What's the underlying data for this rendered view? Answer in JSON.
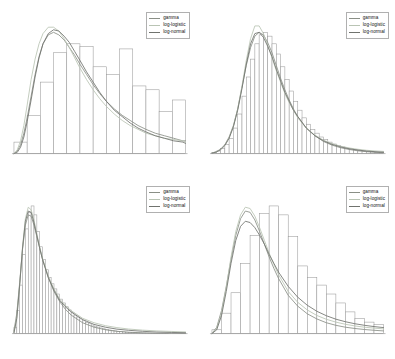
{
  "figure": {
    "kind": "density-comparison-histogram-grid",
    "rows": 2,
    "columns": 2,
    "background": "#ffffff"
  },
  "style": {
    "bar_fill": "#ffffff",
    "bar_stroke": "#9a9a9a",
    "axis_color": "#8f8f8f",
    "legend_border": "#b0b0b0",
    "legend_text_color": "#111111"
  },
  "legend": {
    "position": "top-right",
    "entries": [
      {
        "label": "gamma",
        "color": "#8a8f86"
      },
      {
        "label": "log-logistic",
        "color": "#b9c4b4"
      },
      {
        "label": "log-normal",
        "color": "#70736e"
      }
    ]
  },
  "chart_data": [
    {
      "type": "bar",
      "id": "panel-1",
      "title": "",
      "xlabel": "",
      "ylabel": "",
      "grid": false,
      "legend_position": "top-right",
      "xlim": [
        0,
        13
      ],
      "ylim": [
        0,
        1
      ],
      "categories": [
        "b1",
        "b2",
        "b3",
        "b4",
        "b5",
        "b6",
        "b7",
        "b8",
        "b9",
        "b10",
        "b11",
        "b12",
        "b13"
      ],
      "values": [
        0.09,
        0.3,
        0.56,
        0.79,
        0.86,
        0.84,
        0.68,
        0.62,
        0.82,
        0.53,
        0.5,
        0.33,
        0.42
      ],
      "series": [
        {
          "name": "gamma",
          "color": "#8a8f86",
          "x": [
            0.0,
            0.25,
            0.5,
            0.75,
            1.0,
            1.3,
            1.6,
            1.9,
            2.2,
            2.6,
            3.0,
            3.4,
            3.8,
            4.2,
            4.6,
            5.0,
            5.5,
            6.0,
            6.5,
            7.0,
            7.6,
            8.2,
            8.8,
            9.4,
            10.0,
            10.7,
            11.4,
            12.1,
            12.8,
            13.0
          ],
          "y": [
            0.0,
            0.02,
            0.07,
            0.16,
            0.28,
            0.45,
            0.62,
            0.76,
            0.86,
            0.93,
            0.95,
            0.93,
            0.89,
            0.83,
            0.77,
            0.7,
            0.62,
            0.54,
            0.47,
            0.41,
            0.35,
            0.3,
            0.26,
            0.22,
            0.19,
            0.16,
            0.14,
            0.12,
            0.1,
            0.1
          ]
        },
        {
          "name": "log-logistic",
          "color": "#b9c4b4",
          "x": [
            0.0,
            0.25,
            0.5,
            0.75,
            1.0,
            1.3,
            1.6,
            1.9,
            2.2,
            2.6,
            3.0,
            3.4,
            3.8,
            4.2,
            4.6,
            5.0,
            5.5,
            6.0,
            6.5,
            7.0,
            7.6,
            8.2,
            8.8,
            9.4,
            10.0,
            10.7,
            11.4,
            12.1,
            12.8,
            13.0
          ],
          "y": [
            0.0,
            0.03,
            0.1,
            0.22,
            0.38,
            0.58,
            0.74,
            0.86,
            0.94,
            0.99,
            0.99,
            0.96,
            0.9,
            0.83,
            0.75,
            0.67,
            0.58,
            0.5,
            0.43,
            0.37,
            0.31,
            0.26,
            0.22,
            0.19,
            0.16,
            0.14,
            0.12,
            0.11,
            0.1,
            0.09
          ]
        },
        {
          "name": "log-normal",
          "color": "#70736e",
          "x": [
            0.0,
            0.25,
            0.5,
            0.75,
            1.0,
            1.3,
            1.6,
            1.9,
            2.2,
            2.6,
            3.0,
            3.4,
            3.8,
            4.2,
            4.6,
            5.0,
            5.5,
            6.0,
            6.5,
            7.0,
            7.6,
            8.2,
            8.8,
            9.4,
            10.0,
            10.7,
            11.4,
            12.1,
            12.8,
            13.0
          ],
          "y": [
            0.0,
            0.01,
            0.05,
            0.13,
            0.25,
            0.42,
            0.6,
            0.75,
            0.86,
            0.94,
            0.97,
            0.96,
            0.92,
            0.87,
            0.8,
            0.73,
            0.64,
            0.56,
            0.48,
            0.41,
            0.34,
            0.29,
            0.24,
            0.2,
            0.17,
            0.14,
            0.12,
            0.1,
            0.09,
            0.08
          ]
        }
      ]
    },
    {
      "type": "bar",
      "id": "panel-2",
      "title": "",
      "xlabel": "",
      "ylabel": "",
      "grid": false,
      "legend_position": "top-right",
      "xlim": [
        0,
        40
      ],
      "ylim": [
        0,
        1
      ],
      "categories": [
        "b1",
        "b2",
        "b3",
        "b4",
        "b5",
        "b6",
        "b7",
        "b8",
        "b9",
        "b10",
        "b11",
        "b12",
        "b13",
        "b14",
        "b15",
        "b16",
        "b17",
        "b18",
        "b19",
        "b20",
        "b21",
        "b22",
        "b23",
        "b24",
        "b25",
        "b26",
        "b27",
        "b28",
        "b29",
        "b30",
        "b31",
        "b32",
        "b33",
        "b34",
        "b35",
        "b36",
        "b37",
        "b38",
        "b39",
        "b40"
      ],
      "values": [
        0.01,
        0.02,
        0.04,
        0.07,
        0.12,
        0.2,
        0.31,
        0.45,
        0.6,
        0.74,
        0.86,
        0.93,
        0.95,
        0.92,
        0.86,
        0.78,
        0.68,
        0.58,
        0.49,
        0.41,
        0.34,
        0.28,
        0.23,
        0.19,
        0.16,
        0.13,
        0.11,
        0.09,
        0.075,
        0.062,
        0.052,
        0.043,
        0.036,
        0.03,
        0.025,
        0.021,
        0.017,
        0.014,
        0.011,
        0.008
      ],
      "series": [
        {
          "name": "gamma",
          "color": "#8a8f86",
          "x": [
            0,
            1,
            2,
            3,
            4,
            5,
            6,
            7,
            8,
            9,
            10,
            11,
            12,
            13,
            14,
            15,
            16,
            17,
            18,
            19,
            20,
            22,
            24,
            26,
            28,
            30,
            32,
            34,
            36,
            38,
            40
          ],
          "y": [
            0.005,
            0.015,
            0.035,
            0.07,
            0.13,
            0.22,
            0.35,
            0.52,
            0.69,
            0.83,
            0.92,
            0.95,
            0.93,
            0.87,
            0.79,
            0.69,
            0.59,
            0.5,
            0.42,
            0.35,
            0.29,
            0.2,
            0.14,
            0.095,
            0.066,
            0.046,
            0.032,
            0.022,
            0.015,
            0.01,
            0.007
          ]
        },
        {
          "name": "log-logistic",
          "color": "#b9c4b4",
          "x": [
            0,
            1,
            2,
            3,
            4,
            5,
            6,
            7,
            8,
            9,
            10,
            11,
            12,
            13,
            14,
            15,
            16,
            17,
            18,
            19,
            20,
            22,
            24,
            26,
            28,
            30,
            32,
            34,
            36,
            38,
            40
          ],
          "y": [
            0.004,
            0.013,
            0.032,
            0.065,
            0.125,
            0.215,
            0.35,
            0.53,
            0.73,
            0.9,
            1.0,
            1.0,
            0.94,
            0.85,
            0.75,
            0.65,
            0.56,
            0.47,
            0.4,
            0.34,
            0.28,
            0.2,
            0.145,
            0.105,
            0.078,
            0.058,
            0.044,
            0.034,
            0.026,
            0.021,
            0.017
          ]
        },
        {
          "name": "log-normal",
          "color": "#70736e",
          "x": [
            0,
            1,
            2,
            3,
            4,
            5,
            6,
            7,
            8,
            9,
            10,
            11,
            12,
            13,
            14,
            15,
            16,
            17,
            18,
            19,
            20,
            22,
            24,
            26,
            28,
            30,
            32,
            34,
            36,
            38,
            40
          ],
          "y": [
            0.003,
            0.012,
            0.03,
            0.063,
            0.12,
            0.21,
            0.34,
            0.51,
            0.7,
            0.86,
            0.94,
            0.95,
            0.91,
            0.84,
            0.76,
            0.66,
            0.57,
            0.48,
            0.41,
            0.34,
            0.29,
            0.2,
            0.14,
            0.1,
            0.072,
            0.052,
            0.038,
            0.028,
            0.02,
            0.015,
            0.011
          ]
        }
      ]
    },
    {
      "type": "bar",
      "id": "panel-3",
      "title": "",
      "xlabel": "",
      "ylabel": "",
      "grid": false,
      "legend_position": "top-right",
      "xlim": [
        0,
        60
      ],
      "ylim": [
        0,
        1
      ],
      "categories": [
        "b1",
        "b2",
        "b3",
        "b4",
        "b5",
        "b6",
        "b7",
        "b8",
        "b9",
        "b10",
        "b11",
        "b12",
        "b13",
        "b14",
        "b15",
        "b16",
        "b17",
        "b18",
        "b19",
        "b20",
        "b21",
        "b22",
        "b23",
        "b24",
        "b25",
        "b26",
        "b27",
        "b28",
        "b29",
        "b30",
        "b31",
        "b32",
        "b33",
        "b34",
        "b35",
        "b36",
        "b37",
        "b38",
        "b39",
        "b40",
        "b41",
        "b42",
        "b43",
        "b44",
        "b45",
        "b46",
        "b47",
        "b48",
        "b49",
        "b50",
        "b51",
        "b52",
        "b53",
        "b54",
        "b55",
        "b56",
        "b57",
        "b58",
        "b59",
        "b60"
      ],
      "values": [
        0.05,
        0.18,
        0.38,
        0.62,
        0.82,
        0.95,
        1.0,
        0.93,
        0.8,
        0.68,
        0.58,
        0.5,
        0.44,
        0.39,
        0.35,
        0.31,
        0.27,
        0.24,
        0.21,
        0.185,
        0.163,
        0.145,
        0.13,
        0.115,
        0.1,
        0.088,
        0.077,
        0.067,
        0.058,
        0.051,
        0.044,
        0.038,
        0.033,
        0.028,
        0.024,
        0.021,
        0.018,
        0.015,
        0.013,
        0.011,
        0.0095,
        0.008,
        0.007,
        0.006,
        0.005,
        0.0043,
        0.0037,
        0.0031,
        0.0027,
        0.0023,
        0.0019,
        0.0016,
        0.0014,
        0.0012,
        0.001,
        0.0008,
        0.0007,
        0.0006,
        0.0005,
        0.0004
      ],
      "series": [
        {
          "name": "gamma",
          "color": "#8a8f86",
          "x": [
            0,
            1,
            2,
            3,
            4,
            5,
            6,
            7,
            8,
            9,
            10,
            12,
            14,
            16,
            18,
            20,
            24,
            28,
            32,
            36,
            40,
            45,
            50,
            55,
            60
          ],
          "y": [
            0.02,
            0.16,
            0.4,
            0.66,
            0.85,
            0.93,
            0.92,
            0.85,
            0.76,
            0.67,
            0.58,
            0.44,
            0.33,
            0.25,
            0.19,
            0.145,
            0.085,
            0.05,
            0.03,
            0.018,
            0.011,
            0.006,
            0.003,
            0.002,
            0.001
          ]
        },
        {
          "name": "log-logistic",
          "color": "#b9c4b4",
          "x": [
            0,
            1,
            2,
            3,
            4,
            5,
            6,
            7,
            8,
            9,
            10,
            12,
            14,
            16,
            18,
            20,
            24,
            28,
            32,
            36,
            40,
            45,
            50,
            55,
            60
          ],
          "y": [
            0.01,
            0.13,
            0.38,
            0.68,
            0.9,
            0.99,
            0.97,
            0.89,
            0.78,
            0.68,
            0.59,
            0.45,
            0.35,
            0.27,
            0.22,
            0.18,
            0.12,
            0.085,
            0.062,
            0.047,
            0.036,
            0.027,
            0.021,
            0.017,
            0.013
          ]
        },
        {
          "name": "log-normal",
          "color": "#70736e",
          "x": [
            0,
            1,
            2,
            3,
            4,
            5,
            6,
            7,
            8,
            9,
            10,
            12,
            14,
            16,
            18,
            20,
            24,
            28,
            32,
            36,
            40,
            45,
            50,
            55,
            60
          ],
          "y": [
            0.005,
            0.12,
            0.38,
            0.67,
            0.88,
            0.96,
            0.95,
            0.87,
            0.77,
            0.67,
            0.58,
            0.44,
            0.34,
            0.26,
            0.21,
            0.17,
            0.11,
            0.072,
            0.05,
            0.035,
            0.026,
            0.018,
            0.012,
            0.009,
            0.007
          ]
        }
      ]
    },
    {
      "type": "bar",
      "id": "panel-4",
      "title": "",
      "xlabel": "",
      "ylabel": "",
      "grid": false,
      "legend_position": "top-right",
      "xlim": [
        0,
        18
      ],
      "ylim": [
        0,
        1
      ],
      "categories": [
        "b1",
        "b2",
        "b3",
        "b4",
        "b5",
        "b6",
        "b7",
        "b8",
        "b9",
        "b10",
        "b11",
        "b12",
        "b13",
        "b14",
        "b15",
        "b16",
        "b17",
        "b18"
      ],
      "values": [
        0.03,
        0.16,
        0.32,
        0.55,
        0.77,
        0.94,
        1.0,
        0.93,
        0.76,
        0.53,
        0.44,
        0.38,
        0.31,
        0.24,
        0.17,
        0.12,
        0.09,
        0.07
      ],
      "series": [
        {
          "name": "gamma",
          "color": "#8a8f86",
          "x": [
            0.0,
            0.5,
            1.0,
            1.5,
            2.0,
            2.5,
            3.0,
            3.5,
            4.0,
            4.5,
            5.0,
            5.5,
            6.0,
            6.5,
            7.0,
            8.0,
            9.0,
            10.0,
            11.0,
            12.0,
            13.0,
            14.0,
            15.0,
            16.0,
            17.0,
            18.0
          ],
          "y": [
            0.0,
            0.05,
            0.18,
            0.37,
            0.58,
            0.77,
            0.9,
            0.96,
            0.95,
            0.89,
            0.8,
            0.7,
            0.6,
            0.51,
            0.43,
            0.3,
            0.215,
            0.155,
            0.115,
            0.085,
            0.065,
            0.05,
            0.04,
            0.032,
            0.026,
            0.021
          ]
        },
        {
          "name": "log-logistic",
          "color": "#b9c4b4",
          "x": [
            0.0,
            0.5,
            1.0,
            1.5,
            2.0,
            2.5,
            3.0,
            3.5,
            4.0,
            4.5,
            5.0,
            5.5,
            6.0,
            6.5,
            7.0,
            8.0,
            9.0,
            10.0,
            11.0,
            12.0,
            13.0,
            14.0,
            15.0,
            16.0,
            17.0,
            18.0
          ],
          "y": [
            0.0,
            0.04,
            0.16,
            0.36,
            0.6,
            0.8,
            0.93,
            0.99,
            0.98,
            0.92,
            0.83,
            0.73,
            0.63,
            0.54,
            0.46,
            0.33,
            0.245,
            0.185,
            0.142,
            0.112,
            0.09,
            0.073,
            0.06,
            0.05,
            0.043,
            0.037
          ]
        },
        {
          "name": "log-normal",
          "color": "#70736e",
          "x": [
            0.0,
            0.5,
            1.0,
            1.5,
            2.0,
            2.5,
            3.0,
            3.5,
            4.0,
            4.5,
            5.0,
            5.5,
            6.0,
            6.5,
            7.0,
            8.0,
            9.0,
            10.0,
            11.0,
            12.0,
            13.0,
            14.0,
            15.0,
            16.0,
            17.0,
            18.0
          ],
          "y": [
            0.0,
            0.03,
            0.14,
            0.33,
            0.55,
            0.73,
            0.84,
            0.88,
            0.87,
            0.83,
            0.77,
            0.7,
            0.62,
            0.55,
            0.48,
            0.37,
            0.285,
            0.222,
            0.175,
            0.14,
            0.113,
            0.093,
            0.077,
            0.065,
            0.055,
            0.047
          ]
        }
      ]
    }
  ]
}
